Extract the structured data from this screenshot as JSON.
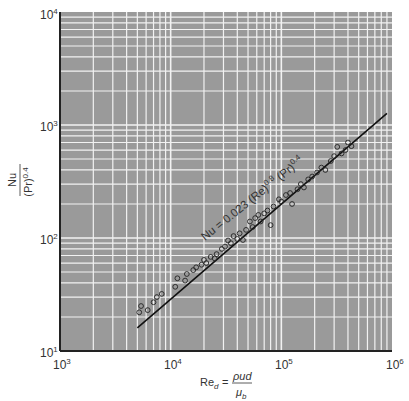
{
  "chart_data": {
    "type": "scatter",
    "title": "",
    "xlabel": "Re_d = ρud / μ_b",
    "ylabel": "Nu / (Pr)^0.4",
    "xscale": "log",
    "yscale": "log",
    "xlim": [
      1000,
      1000000
    ],
    "ylim": [
      10,
      10000
    ],
    "grid": true,
    "x_ticks": [
      "10^3",
      "10^4",
      "10^5",
      "10^6"
    ],
    "y_ticks": [
      "10^1",
      "10^2",
      "10^3",
      "10^4"
    ],
    "annotation": "Nu = 0.023 (Re)^0.8 (Pr)^0.4",
    "fit_line": {
      "name": "Nu = 0.023 Re^0.8 Pr^0.4",
      "x": [
        5000,
        900000
      ],
      "y": [
        16,
        1270
      ]
    },
    "series": [
      {
        "name": "experimental data",
        "marker": "open-circle",
        "points": [
          [
            5200,
            22
          ],
          [
            5400,
            25
          ],
          [
            6200,
            23
          ],
          [
            7000,
            27
          ],
          [
            7500,
            30
          ],
          [
            8300,
            32
          ],
          [
            11000,
            37
          ],
          [
            11500,
            44
          ],
          [
            13500,
            42
          ],
          [
            14000,
            48
          ],
          [
            16000,
            52
          ],
          [
            17000,
            55
          ],
          [
            19000,
            58
          ],
          [
            20000,
            64
          ],
          [
            21000,
            60
          ],
          [
            23000,
            68
          ],
          [
            25000,
            66
          ],
          [
            26000,
            72
          ],
          [
            29000,
            80
          ],
          [
            31000,
            84
          ],
          [
            33000,
            95
          ],
          [
            35000,
            90
          ],
          [
            37000,
            104
          ],
          [
            40000,
            98
          ],
          [
            42000,
            110
          ],
          [
            45000,
            96
          ],
          [
            48000,
            118
          ],
          [
            52000,
            140
          ],
          [
            55000,
            125
          ],
          [
            58000,
            150
          ],
          [
            62000,
            160
          ],
          [
            65000,
            140
          ],
          [
            70000,
            165
          ],
          [
            75000,
            175
          ],
          [
            80000,
            130
          ],
          [
            85000,
            190
          ],
          [
            95000,
            220
          ],
          [
            100000,
            210
          ],
          [
            110000,
            240
          ],
          [
            120000,
            250
          ],
          [
            125000,
            200
          ],
          [
            140000,
            270
          ],
          [
            150000,
            300
          ],
          [
            160000,
            280
          ],
          [
            175000,
            330
          ],
          [
            190000,
            350
          ],
          [
            210000,
            380
          ],
          [
            230000,
            420
          ],
          [
            250000,
            400
          ],
          [
            280000,
            480
          ],
          [
            300000,
            530
          ],
          [
            320000,
            640
          ],
          [
            350000,
            560
          ],
          [
            380000,
            600
          ],
          [
            400000,
            700
          ],
          [
            430000,
            650
          ]
        ]
      }
    ]
  },
  "axes": {
    "x_ticks": [
      {
        "base": "10",
        "exp": "3"
      },
      {
        "base": "10",
        "exp": "4"
      },
      {
        "base": "10",
        "exp": "5"
      },
      {
        "base": "10",
        "exp": "6"
      }
    ],
    "y_ticks": [
      {
        "base": "10",
        "exp": "1"
      },
      {
        "base": "10",
        "exp": "2"
      },
      {
        "base": "10",
        "exp": "3"
      },
      {
        "base": "10",
        "exp": "4"
      }
    ],
    "xlabel": {
      "lhs": "Re",
      "lhs_sub": "d",
      "eq": "=",
      "num": "ρud",
      "den": "μ",
      "den_sub": "b"
    },
    "ylabel": {
      "num": "Nu",
      "den": "(Pr)",
      "den_exp": "0.4"
    },
    "annotation": {
      "a": "Nu = 0.023 (Re)",
      "e1": "0.8",
      "b": " (Pr)",
      "e2": "0.4"
    }
  },
  "colors": {
    "plot_bg": "#9a9a9a",
    "grid": "#f2f2f2",
    "axis": "#222222",
    "line": "#111111",
    "marker": "#222222"
  }
}
